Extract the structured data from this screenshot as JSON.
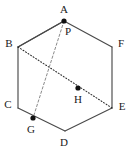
{
  "figure": {
    "shape": "hexagon",
    "background_color": "#ffffff",
    "line_color": "#4a4a4a",
    "dot_color": "#111111",
    "label_color": "#1a1a1a",
    "vertices": [
      {
        "id": "A",
        "label": "A",
        "x": 64,
        "y": 21,
        "label_x": 64,
        "label_y": 10,
        "marked": true
      },
      {
        "id": "B",
        "label": "B",
        "x": 18,
        "y": 47,
        "label_x": 9,
        "label_y": 44,
        "marked": false
      },
      {
        "id": "C",
        "label": "C",
        "x": 18,
        "y": 108,
        "label_x": 8,
        "label_y": 105,
        "marked": false
      },
      {
        "id": "D",
        "label": "D",
        "x": 65,
        "y": 131,
        "label_x": 64,
        "label_y": 143,
        "marked": false
      },
      {
        "id": "E",
        "label": "E",
        "x": 112,
        "y": 108,
        "label_x": 122,
        "label_y": 107,
        "marked": false
      },
      {
        "id": "F",
        "label": "F",
        "x": 112,
        "y": 47,
        "label_x": 121,
        "label_y": 44,
        "marked": false
      }
    ],
    "interior_points": [
      {
        "id": "P",
        "label": "P",
        "x": 64,
        "y": 21,
        "label_x": 68,
        "label_y": 32,
        "marked": false
      },
      {
        "id": "G",
        "label": "G",
        "x": 33,
        "y": 118,
        "label_x": 31,
        "label_y": 130,
        "marked": true
      },
      {
        "id": "H",
        "label": "H",
        "x": 78,
        "y": 88,
        "label_x": 78,
        "label_y": 100,
        "marked": true
      }
    ],
    "edges": [
      {
        "from": "A",
        "to": "B",
        "style": "solid"
      },
      {
        "from": "B",
        "to": "C",
        "style": "solid"
      },
      {
        "from": "C",
        "to": "D",
        "style": "solid"
      },
      {
        "from": "D",
        "to": "E",
        "style": "solid"
      },
      {
        "from": "E",
        "to": "F",
        "style": "solid"
      },
      {
        "from": "F",
        "to": "A",
        "style": "solid"
      }
    ],
    "construction_lines": [
      {
        "id": "chord-b-to-apex",
        "from": "B",
        "to": "A",
        "style": "solid"
      },
      {
        "id": "dotted-b-to-e",
        "from": "B",
        "to": "E",
        "style": "dotted"
      },
      {
        "id": "dashed-p-to-g",
        "from": "P",
        "to": "G",
        "style": "dashed"
      }
    ]
  }
}
